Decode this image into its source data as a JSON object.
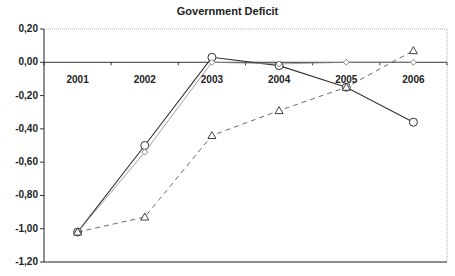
{
  "chart_data": {
    "type": "line",
    "title": "Government Deficit",
    "xlabel": "",
    "ylabel": "",
    "categories": [
      "2001",
      "2002",
      "2003",
      "2004",
      "2005",
      "2006"
    ],
    "ylim": [
      -1.2,
      0.2
    ],
    "yticks": [
      "0,20",
      "0,00",
      "-0,20",
      "-0,40",
      "-0,60",
      "-0,80",
      "-1,00",
      "-1,20"
    ],
    "ytick_values": [
      0.2,
      0.0,
      -0.2,
      -0.4,
      -0.6,
      -0.8,
      -1.0,
      -1.2
    ],
    "grid": false,
    "legend": null,
    "series": [
      {
        "name": "Series A (solid, circle markers)",
        "style": "solid",
        "marker": "circle",
        "color": "#333333",
        "values": [
          -1.02,
          -0.5,
          0.03,
          -0.02,
          -0.15,
          -0.36
        ]
      },
      {
        "name": "Series B (thin solid, diamond markers)",
        "style": "solid-light",
        "marker": "diamond",
        "color": "#888888",
        "values": [
          -1.02,
          -0.54,
          0.0,
          -0.01,
          0.0,
          0.0
        ]
      },
      {
        "name": "Series C (dashed, triangle markers)",
        "style": "dashed",
        "marker": "triangle",
        "color": "#444444",
        "values": [
          -1.02,
          -0.93,
          -0.44,
          -0.29,
          -0.15,
          0.07
        ]
      }
    ]
  }
}
